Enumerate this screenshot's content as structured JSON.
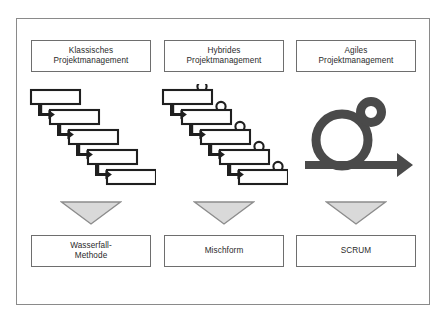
{
  "diagram": {
    "title_visible": false,
    "frame": {
      "border_color": "#8a8a8a"
    },
    "colors": {
      "box_border": "#6e6e6e",
      "text": "#2a2a2a",
      "art_stroke": "#1f1f1f",
      "triangle_fill": "#d9d9d9",
      "triangle_border": "#8c8c8c",
      "scrum_icon": "#4a4a4a",
      "background": "#ffffff"
    },
    "columns": [
      {
        "id": "klassisch",
        "header": {
          "line1": "Klassisches",
          "line2": "Projektmanagement"
        },
        "art": "waterfall-cascade-icon",
        "art_description": "Five cascading rectangles connected by L-shaped down-right arrows",
        "art_step_count": 5,
        "arrow": "down-triangle-icon",
        "result": {
          "line1": "Wasserfall-",
          "line2": "Methode"
        }
      },
      {
        "id": "hybrid",
        "header": {
          "line1": "Hybrides",
          "line2": "Projektmanagement"
        },
        "art": "hybrid-cascade-person-icon",
        "art_description": "Five cascading rectangles with person circles on top-right, connected by L-shaped arrows",
        "art_step_count": 5,
        "arrow": "down-triangle-icon",
        "result": {
          "line1": "Mischform",
          "line2": ""
        }
      },
      {
        "id": "agil",
        "header": {
          "line1": "Agiles",
          "line2": "Projektmanagement"
        },
        "art": "scrum-sprint-icon",
        "art_description": "Large ring with small ring at upper right above a horizontal right arrow",
        "art_step_count": 0,
        "arrow": "down-triangle-icon",
        "result": {
          "line1": "SCRUM",
          "line2": ""
        }
      }
    ]
  }
}
